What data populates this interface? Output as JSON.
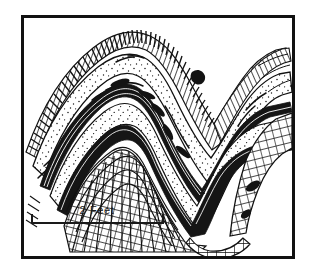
{
  "figure": {
    "kind": "line-drawing",
    "background_color": "#ffffff",
    "ink_color": "#111111",
    "frame": {
      "name": "figure-border",
      "x": 21,
      "y": 15,
      "width": 273,
      "height": 243,
      "stroke_width": 3,
      "stroke_color": "#111111",
      "fill": "#ffffff"
    }
  },
  "scale_bar": {
    "label": "2 Feet",
    "x_start": 32,
    "x_end": 163,
    "y": 222,
    "tick_height": 8,
    "stroke_width": 2,
    "label_x": 97,
    "label_y": 214
  },
  "structure": {
    "description": "Asymmetric anticline on the left and tight V-shaped syncline on the right",
    "fold_names": [
      "anticline-crest",
      "syncline-hinge"
    ],
    "anticline_crest_x": 132,
    "anticline_crest_y": 35,
    "syncline_hinge_x": 214,
    "syncline_hinge_y": 150
  },
  "layers": [
    {
      "id": "layer-hachured-outer",
      "name": "outer-hachured-bed",
      "pattern": "hachure-ticks",
      "order": 1
    },
    {
      "id": "layer-stipple-upper",
      "name": "upper-stippled-bed",
      "pattern": "stipple-dots-dashes",
      "order": 2
    },
    {
      "id": "layer-dark-marker-upper",
      "name": "upper-dark-marker-bed",
      "pattern": "solid-dark-band",
      "order": 3
    },
    {
      "id": "layer-stipple-middle",
      "name": "middle-stippled-bed",
      "pattern": "stipple-dots",
      "order": 4
    },
    {
      "id": "layer-dark-marker-middle",
      "name": "middle-dark-marker-bed",
      "pattern": "solid-dark-band",
      "order": 5
    },
    {
      "id": "layer-crosshatch-core",
      "name": "crosshatched-core-bed",
      "pattern": "cross-hatch-grid",
      "order": 6
    },
    {
      "id": "layer-crosshatch-right",
      "name": "right-limb-crosshatched-bed",
      "pattern": "cross-hatch-grid",
      "order": 7
    }
  ],
  "inclusions": [
    {
      "name": "dark-lens-pod",
      "cx": 120,
      "cy": 83,
      "rx": 10,
      "ry": 3.5,
      "rot": -18
    },
    {
      "name": "dark-lens-pod",
      "cx": 147,
      "cy": 95,
      "rx": 9,
      "ry": 3,
      "rot": 20
    },
    {
      "name": "dark-lens-pod",
      "cx": 157,
      "cy": 107,
      "rx": 8,
      "ry": 3,
      "rot": 42
    },
    {
      "name": "dark-lens-pod",
      "cx": 166,
      "cy": 128,
      "rx": 9,
      "ry": 3,
      "rot": 58
    },
    {
      "name": "dark-lens-pod",
      "cx": 182,
      "cy": 150,
      "rx": 9,
      "ry": 3,
      "rot": 38
    },
    {
      "name": "dark-lens-pod",
      "cx": 196,
      "cy": 77,
      "rx": 7,
      "ry": 4,
      "rot": 10
    },
    {
      "name": "dark-lens-pod",
      "cx": 253,
      "cy": 186,
      "rx": 8,
      "ry": 4,
      "rot": -30
    }
  ]
}
